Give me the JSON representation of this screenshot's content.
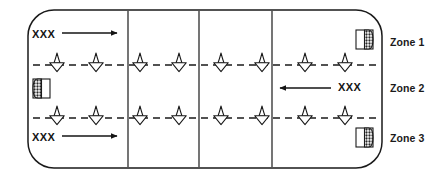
{
  "diagram": {
    "stroke_color": "#1a1a1a",
    "background_color": "#ffffff",
    "field": {
      "shape": "rounded-rectangle",
      "x": 28,
      "y": 10,
      "width": 354,
      "height": 158,
      "corner_radius": 26
    },
    "vertical_dividers": [
      128,
      199,
      272
    ],
    "dashed_lines": [
      {
        "name": "upper-zone-divider",
        "y": 65
      },
      {
        "name": "lower-zone-divider",
        "y": 118
      }
    ],
    "zones": [
      {
        "id": "zone-1",
        "label": "Zone 1"
      },
      {
        "id": "zone-2",
        "label": "Zone 2"
      },
      {
        "id": "zone-3",
        "label": "Zone 3"
      }
    ],
    "flow_arrows": [
      {
        "id": "flow-top",
        "label": "XXX",
        "direction": "right",
        "zone": "Zone 1",
        "x1": 62,
        "x2": 117,
        "y": 33
      },
      {
        "id": "flow-middle",
        "label": "XXX",
        "direction": "left",
        "zone": "Zone 2",
        "x1": 331,
        "x2": 280,
        "y": 88
      },
      {
        "id": "flow-bottom",
        "label": "XXX",
        "direction": "right",
        "zone": "Zone 3",
        "x1": 62,
        "x2": 117,
        "y": 136
      }
    ],
    "nozzle_symbols": {
      "icon": "nozzle-symbol",
      "rows": [
        {
          "name": "upper-nozzle-row",
          "y": 65,
          "x": [
            57,
            96,
            140,
            179,
            221,
            262,
            305,
            345
          ]
        },
        {
          "name": "lower-nozzle-row",
          "y": 118,
          "x": [
            57,
            96,
            140,
            179,
            221,
            262,
            305,
            345
          ]
        }
      ]
    },
    "block_markers": [
      {
        "id": "block-marker-zone-1",
        "icon": "half-hatched-block-icon",
        "orientation": "hatched-right",
        "x": 356,
        "y": 30,
        "width": 17,
        "height": 19
      },
      {
        "id": "block-marker-zone-2",
        "icon": "half-hatched-block-icon",
        "orientation": "hatched-left",
        "x": 33,
        "y": 79,
        "width": 17,
        "height": 19
      },
      {
        "id": "block-marker-zone-3",
        "icon": "half-hatched-block-icon",
        "orientation": "hatched-right",
        "x": 356,
        "y": 128,
        "width": 17,
        "height": 19
      }
    ]
  }
}
